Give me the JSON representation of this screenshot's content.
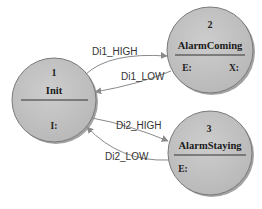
{
  "diagram": {
    "type": "state-machine",
    "colors": {
      "state_fill": "#c4c4c4",
      "state_stroke": "#7a7a7a",
      "shadow": "#8c8c8c",
      "edge": "#8a8a8a",
      "text": "#222222"
    },
    "states": [
      {
        "id": "1",
        "number": "1",
        "name": "Init",
        "actions": [
          "I:"
        ]
      },
      {
        "id": "2",
        "number": "2",
        "name": "AlarmComing",
        "actions": [
          "E:",
          "X:"
        ]
      },
      {
        "id": "3",
        "number": "3",
        "name": "AlarmStaying",
        "actions": [
          "E:"
        ]
      }
    ],
    "transitions": [
      {
        "from": "1",
        "to": "2",
        "label": "Di1_HIGH"
      },
      {
        "from": "2",
        "to": "1",
        "label": "Di1_LOW"
      },
      {
        "from": "1",
        "to": "3",
        "label": "Di2_HIGH"
      },
      {
        "from": "3",
        "to": "1",
        "label": "Di2_LOW"
      }
    ]
  }
}
